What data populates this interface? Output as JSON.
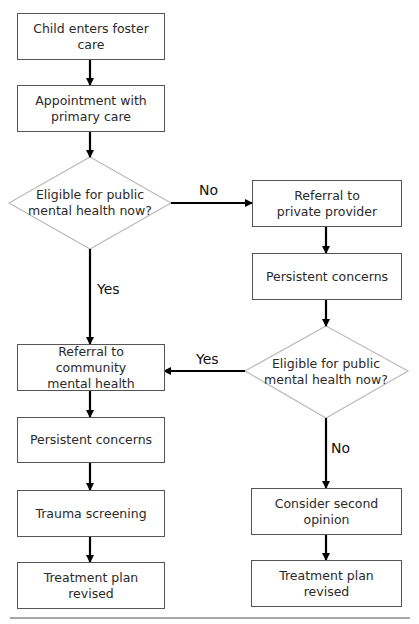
{
  "diagram": {
    "type": "flowchart",
    "nodes": {
      "start": {
        "label": "Child enters foster care"
      },
      "primary_care": {
        "label_line1": "Appointment with",
        "label_line2": "primary care"
      },
      "decision1": {
        "label_line1": "Eligible for public",
        "label_line2": "mental health now?"
      },
      "private_referral": {
        "label_line1": "Referral to",
        "label_line2": "private provider"
      },
      "right_concerns": {
        "label": "Persistent concerns"
      },
      "decision2": {
        "label_line1": "Eligible for public",
        "label_line2": "mental health now?"
      },
      "community_referral": {
        "label_line1": "Referral to community",
        "label_line2": "mental health"
      },
      "left_concerns": {
        "label": "Persistent concerns"
      },
      "trauma": {
        "label": "Trauma screening"
      },
      "left_plan": {
        "label_line1": "Treatment plan",
        "label_line2": "revised"
      },
      "second_opinion": {
        "label": "Consider second opinion"
      },
      "right_plan": {
        "label_line1": "Treatment plan",
        "label_line2": "revised"
      }
    },
    "edge_labels": {
      "decision1_no": "No",
      "decision1_yes": "Yes",
      "decision2_yes": "Yes",
      "decision2_no": "No"
    },
    "colors": {
      "box_border": "#555555",
      "diamond_border": "#bbbbbb",
      "arrow": "#000000",
      "rule": "#888888"
    }
  }
}
